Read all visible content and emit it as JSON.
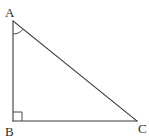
{
  "figure": {
    "kind": "right-triangle",
    "background_color": "#ffffff",
    "stroke_color": "#3b3b3b",
    "label_color": "#2e2e2e",
    "canvas": {
      "width": 149,
      "height": 140
    },
    "vertices": [
      {
        "id": "A",
        "label": "A",
        "x": 13,
        "y": 21,
        "label_x": 5,
        "label_y": 17
      },
      {
        "id": "B",
        "label": "B",
        "x": 13,
        "y": 121,
        "label_x": 5,
        "label_y": 136
      },
      {
        "id": "C",
        "label": "C",
        "x": 137,
        "y": 121,
        "label_x": 138,
        "label_y": 133
      }
    ],
    "edges": [
      {
        "id": "AB",
        "from": "A",
        "to": "B",
        "name": "leg-vertical"
      },
      {
        "id": "BC",
        "from": "B",
        "to": "C",
        "name": "leg-horizontal"
      },
      {
        "id": "AC",
        "from": "A",
        "to": "C",
        "name": "hypotenuse"
      }
    ],
    "angle_marks": [
      {
        "id": "angle-A",
        "at": "A",
        "type": "arc",
        "radius": 13
      },
      {
        "id": "angle-B",
        "at": "B",
        "type": "square",
        "size": 9
      }
    ]
  }
}
